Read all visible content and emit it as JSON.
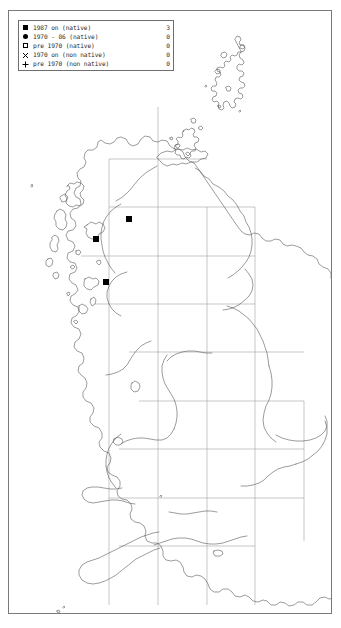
{
  "map": {
    "title": "Great Britain distribution map",
    "region": "British Isles",
    "grid": {
      "visible": true,
      "vertical_x": [
        108,
        157,
        206,
        254,
        303
      ],
      "horizontal_y": [
        157,
        214,
        265,
        313,
        360,
        409,
        456,
        504,
        552
      ],
      "spacing_px": 48
    },
    "colors": {
      "coastline": "#4a4a4a",
      "gridline": "#8d8d8d",
      "frame": "#7a7a7a",
      "marker": "#000000",
      "background": "#ffffff"
    },
    "records": [
      {
        "label": "record-1",
        "symbol": "filled-square",
        "x": 120,
        "y": 208
      },
      {
        "label": "record-2",
        "symbol": "filled-square",
        "x": 87,
        "y": 228
      },
      {
        "label": "record-3",
        "symbol": "filled-square",
        "x": 97,
        "y": 271
      }
    ]
  },
  "legend": {
    "rows": [
      {
        "symbol": "filled-square",
        "label": "1987 on (native)",
        "count": "3"
      },
      {
        "symbol": "filled-circle",
        "label": "1970 - 86 (native)",
        "count": "0"
      },
      {
        "symbol": "open-square",
        "label": "pre 1970 (native)",
        "count": "0"
      },
      {
        "symbol": "cross",
        "label": "1970 on (non native)",
        "count": "0"
      },
      {
        "symbol": "plus",
        "label": "pre 1970 (non native)",
        "count": "0"
      }
    ]
  }
}
